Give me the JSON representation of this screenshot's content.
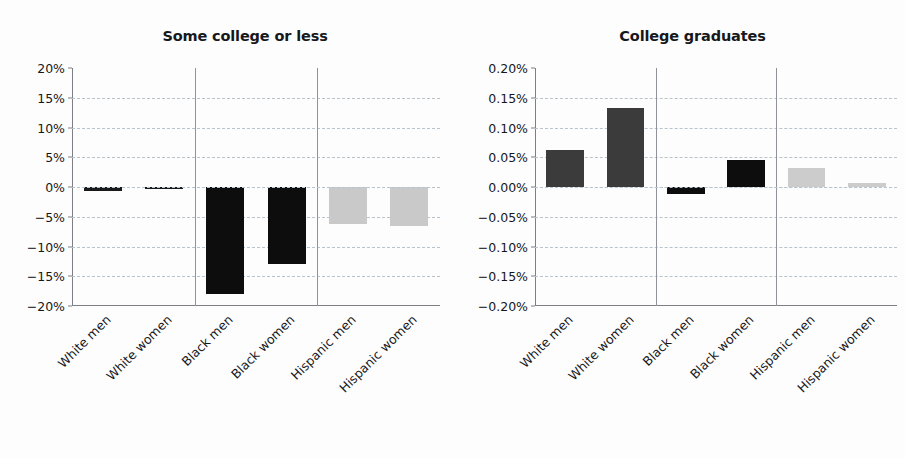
{
  "figure": {
    "background_color": "#fdfdfd",
    "text_color": "#16171b",
    "grid_color": "#b9c3cc",
    "separator_color": "#8f9299"
  },
  "chart_data": [
    {
      "type": "bar",
      "title": "Some college or less",
      "xlabel": "",
      "ylabel": "",
      "grid": true,
      "legend": "none",
      "ylim": [
        -20,
        20
      ],
      "yticks": [
        20,
        15,
        10,
        5,
        0,
        -5,
        -10,
        -15,
        -20
      ],
      "ytick_labels": [
        "20%",
        "15%",
        "10%",
        "5%",
        "0%",
        "−15%",
        "−10%",
        "−15%",
        "−20%"
      ],
      "ytick_labels_display": [
        "20%",
        "15%",
        "10%",
        "5%",
        "0%",
        "−5%",
        "−10%",
        "−15%",
        "−20%"
      ],
      "categories": [
        "White men",
        "White women",
        "Black men",
        "Black women",
        "Hispanic men",
        "Hispanic women"
      ],
      "values": [
        -0.6,
        -0.2,
        -18.0,
        -13.0,
        -6.2,
        -6.6
      ],
      "bar_colors": [
        "#1a1a1a",
        "#1a1a1a",
        "#0d0d0d",
        "#0d0d0d",
        "#c9c9c9",
        "#c9c9c9"
      ],
      "group_separators_after": [
        1,
        3
      ]
    },
    {
      "type": "bar",
      "title": "College graduates",
      "xlabel": "",
      "ylabel": "",
      "grid": true,
      "legend": "none",
      "ylim": [
        -0.2,
        0.2
      ],
      "yticks": [
        0.2,
        0.15,
        0.1,
        0.05,
        0.0,
        -0.05,
        -0.1,
        -0.15,
        -0.2
      ],
      "ytick_labels_display": [
        "0.20%",
        "0.15%",
        "0.10%",
        "0.05%",
        "0.00%",
        "−0.05%",
        "−0.10%",
        "−0.15%",
        "−0.20%"
      ],
      "categories": [
        "White men",
        "White women",
        "Black men",
        "Black women",
        "Hispanic men",
        "Hispanic women"
      ],
      "values": [
        0.062,
        0.132,
        -0.012,
        0.046,
        0.032,
        0.006
      ],
      "bar_colors": [
        "#3b3b3b",
        "#3b3b3b",
        "#0d0d0d",
        "#0d0d0d",
        "#cccccc",
        "#cccccc"
      ],
      "group_separators_after": [
        1,
        3
      ]
    }
  ]
}
